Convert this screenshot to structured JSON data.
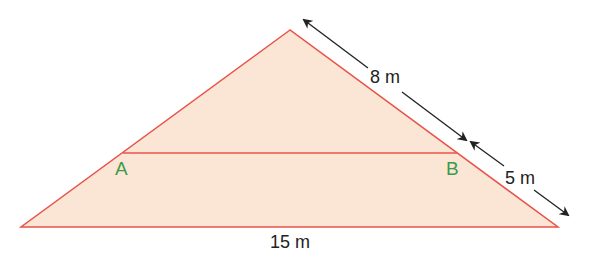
{
  "diagram": {
    "type": "similar-triangles",
    "colors": {
      "fill": "#fbe6d6",
      "stroke": "#e8534a",
      "point_label": "#3c9a4a",
      "measure_label": "#222222",
      "arrow": "#222222"
    },
    "points": {
      "A": {
        "label": "A"
      },
      "B": {
        "label": "B"
      }
    },
    "measurements": {
      "upper_side": "8 m",
      "lower_side": "5 m",
      "base": "15 m"
    }
  }
}
